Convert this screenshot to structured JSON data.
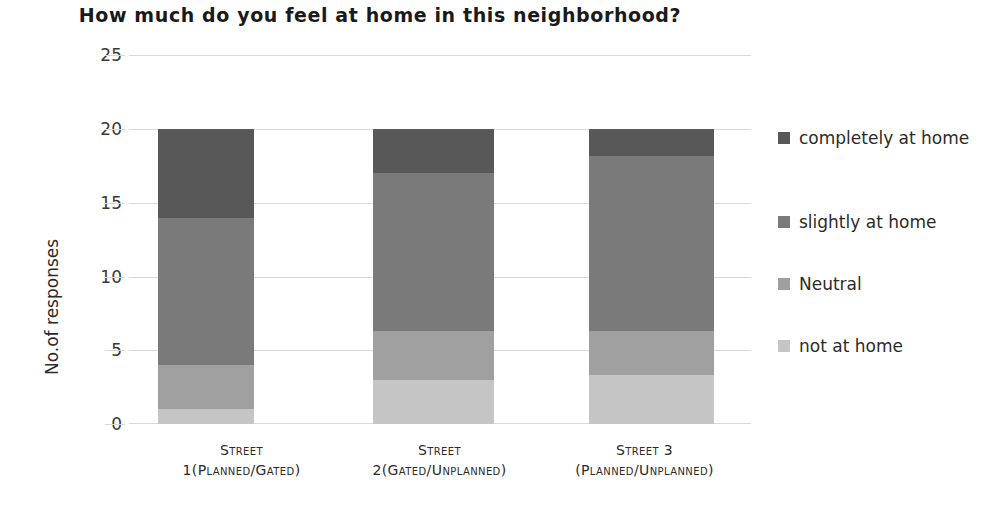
{
  "chart_data": {
    "type": "bar",
    "stacked": true,
    "title": "How much do you feel at home in this neighborhood?",
    "xlabel": "",
    "ylabel": "No.of responses",
    "ylim": [
      0,
      25
    ],
    "yticks": [
      0,
      5,
      10,
      15,
      20,
      25
    ],
    "grid": true,
    "legend_position": "right",
    "categories": [
      {
        "line1": "Street",
        "line2": "1(Planned/Gated)"
      },
      {
        "line1": "Street",
        "line2": "2(Gated/Unplanned)"
      },
      {
        "line1": "Street 3",
        "line2": "(Planned/Unplanned)"
      }
    ],
    "category_labels": [
      "Street 1(Planned/Gated)",
      "Street 2(Gated/Unplanned)",
      "Street 3 (Planned/Unplanned)"
    ],
    "series": [
      {
        "name": "not at home",
        "color": "#c5c5c5",
        "values": [
          1.0,
          3.0,
          3.3
        ]
      },
      {
        "name": "Neutral",
        "color": "#a0a0a0",
        "values": [
          3.0,
          3.3,
          3.0
        ]
      },
      {
        "name": "slightly at home",
        "color": "#7a7a7a",
        "values": [
          10.0,
          10.7,
          11.9
        ]
      },
      {
        "name": "completely at home",
        "color": "#585858",
        "values": [
          6.0,
          3.0,
          1.8
        ]
      }
    ],
    "totals": [
      20,
      20,
      20
    ],
    "stack_order_bottom_to_top": [
      "not at home",
      "Neutral",
      "slightly at home",
      "completely at home"
    ],
    "legend_order_top_to_bottom": [
      "completely at home",
      "slightly at home",
      "Neutral",
      "not at home"
    ],
    "colors": {
      "completely_at_home": "#585858",
      "slightly_at_home": "#7a7a7a",
      "neutral": "#a0a0a0",
      "not_at_home": "#c5c5c5",
      "gridline": "#d9d9d9",
      "text": "#2b2b2b",
      "background": "#ffffff"
    }
  },
  "legend": {
    "items": [
      {
        "label": "completely at home",
        "color": "#585858"
      },
      {
        "label": "slightly at home",
        "color": "#7a7a7a"
      },
      {
        "label": "Neutral",
        "color": "#a0a0a0"
      },
      {
        "label": "not at home",
        "color": "#c5c5c5"
      }
    ]
  },
  "axis": {
    "y_title": "No.of responses",
    "y_tick_labels": [
      "25",
      "20",
      "15",
      "10",
      "5",
      "0"
    ]
  }
}
